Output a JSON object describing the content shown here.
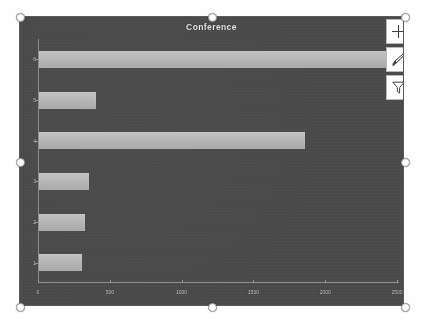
{
  "object": {
    "name": "chart-object",
    "selected": true,
    "handles": [
      "top-left",
      "top-center",
      "top-right",
      "middle-left",
      "middle-right",
      "bottom-left",
      "bottom-center",
      "bottom-right"
    ]
  },
  "tools": [
    {
      "id": "chart-elements",
      "icon": "plus-icon",
      "label": "Chart Elements"
    },
    {
      "id": "chart-styles",
      "icon": "paintbrush-icon",
      "label": "Chart Styles"
    },
    {
      "id": "chart-filters",
      "icon": "funnel-icon",
      "label": "Chart Filters"
    }
  ],
  "colors": {
    "plot_background": "#4b4b4b",
    "bar_fill": "#b7b7b7",
    "axis": "#8f8f8f",
    "text": "#cfcfcf",
    "title": "#e8e8e8"
  },
  "chart_data": {
    "type": "bar",
    "orientation": "horizontal",
    "title": "Conference",
    "xlabel": "",
    "ylabel": "",
    "categories": [
      "1",
      "2",
      "3",
      "4",
      "5",
      "6"
    ],
    "values": [
      300,
      320,
      350,
      1850,
      400,
      2450
    ],
    "series": [
      {
        "name": "Conference",
        "values": [
          300,
          320,
          350,
          1850,
          400,
          2450
        ]
      }
    ],
    "xlim": [
      0,
      2500
    ],
    "ylim": [
      0,
      6
    ],
    "xticks": [
      0,
      500,
      1000,
      1500,
      2000,
      2500
    ],
    "xticklabels": [
      "0",
      "500",
      "1000",
      "1500",
      "2000",
      "2500"
    ],
    "yticklabels": [
      "1",
      "2",
      "3",
      "4",
      "5",
      "6"
    ],
    "grid": false,
    "legend": false,
    "legend_position": "none"
  }
}
